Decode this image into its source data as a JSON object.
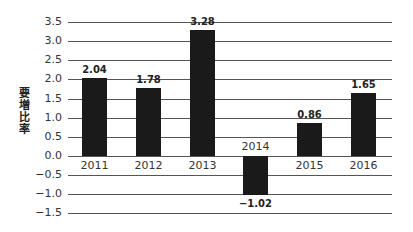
{
  "chart_data": {
    "type": "bar",
    "title": "",
    "xlabel": "",
    "ylabel": "要増比率",
    "categories": [
      "2011",
      "2012",
      "2013",
      "2014",
      "2015",
      "2016"
    ],
    "values": [
      2.04,
      1.78,
      3.28,
      -1.02,
      0.86,
      1.65
    ],
    "value_labels": [
      "2.04",
      "1.78",
      "3.28",
      "-1.02",
      "0.86",
      "1.65"
    ],
    "ylim": [
      -1.5,
      3.5
    ],
    "yticks": [
      "3.5",
      "3.0",
      "2.5",
      "2.0",
      "1.5",
      "1.0",
      "0.5",
      "0.0",
      "-0.5",
      "-1.0",
      "-1.5"
    ],
    "grid": true,
    "legend": null,
    "bar_color": "#1a1a1a"
  }
}
